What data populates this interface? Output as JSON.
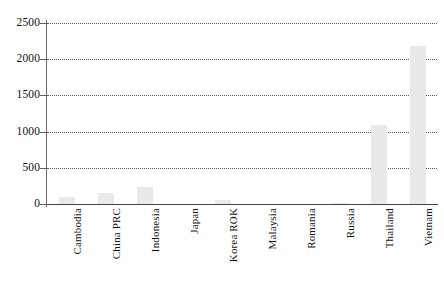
{
  "chart_data": {
    "type": "bar",
    "title": "",
    "xlabel": "",
    "ylabel": "",
    "ylim": [
      0,
      2500
    ],
    "yticks": [
      0,
      500,
      1000,
      1500,
      2000,
      2500
    ],
    "ytick_labels": [
      "0",
      "500",
      "1000",
      "1500",
      "2000",
      "2500"
    ],
    "grid": true,
    "grid_style": "dotted",
    "legend": false,
    "bar_color": "#e9e9e9",
    "categories": [
      "Cambodia",
      "China PRC",
      "Indonesia",
      "Japan",
      "Korea ROK",
      "Malaysia",
      "Romania",
      "Russia",
      "Thailand",
      "Vietnam"
    ],
    "values": [
      100,
      155,
      240,
      0,
      60,
      0,
      0,
      20,
      1090,
      2180
    ]
  },
  "caption": {
    "text": ""
  }
}
